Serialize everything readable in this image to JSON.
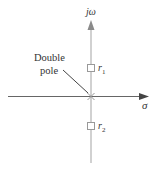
{
  "diagram": {
    "title": "",
    "axes": {
      "vertical_label": "jω",
      "horizontal_label": "σ"
    },
    "annotation": {
      "line1": "Double",
      "line2": "pole"
    },
    "markers": [
      {
        "type": "zero",
        "label": "r",
        "subscript": "1"
      },
      {
        "type": "zero",
        "label": "r",
        "subscript": "2"
      },
      {
        "type": "double-pole",
        "label": "×"
      }
    ],
    "colors": {
      "axis_vertical": "#b0b0b0",
      "axis_horizontal": "#555555",
      "arrow": "#555555",
      "text": "#333333"
    }
  }
}
